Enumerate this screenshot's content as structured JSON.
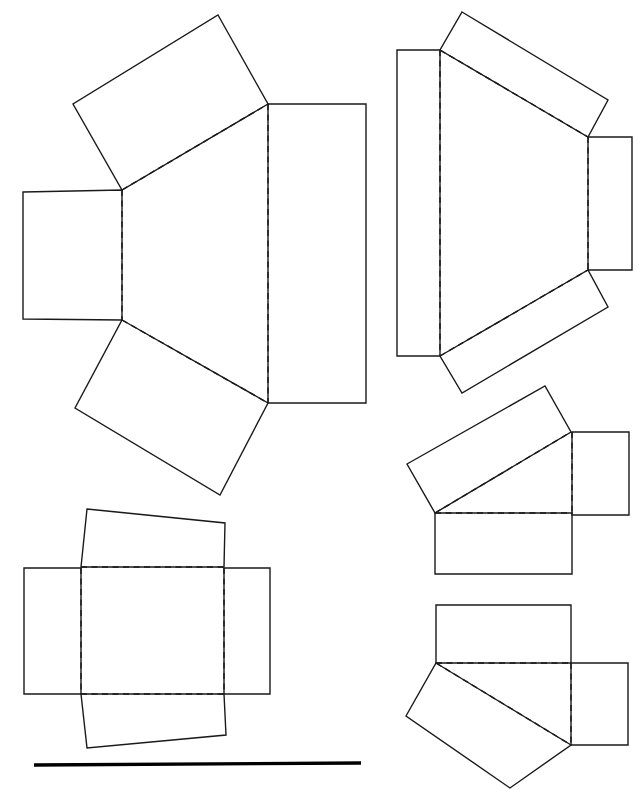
{
  "document": {
    "title": "Box Net Diagrams",
    "subject": "packaging carton blank layouts",
    "background_color": "#ffffff",
    "line_color": "#1a1a1a",
    "rule_color": "#000000",
    "canvas": {
      "width": 641,
      "height": 790
    }
  },
  "legend": {
    "solid_edge_meaning": "cut edge",
    "fold_edge_meaning": "fold / crease line",
    "solid_stroke_width": 1.4,
    "fold_stroke_width": 1.4,
    "fold_dash_pattern": "6 4.5"
  },
  "figures": [
    {
      "id": "figure-1",
      "name": "open-carton-net-large",
      "panel_count": 4,
      "panels": [
        {
          "name": "top-flap-panel",
          "shape": "quadrilateral",
          "points": "218,15 268,104 122,190 73,104",
          "fold_edges": [
            "122,190 268,104"
          ]
        },
        {
          "name": "left-side-panel",
          "shape": "rectangle",
          "points": "23,192 122,190 122,320 23,319",
          "fold_edges": [
            "122,190 122,320"
          ]
        },
        {
          "name": "bottom-flap-panel",
          "shape": "quadrilateral",
          "points": "122,320 268,403 220,495 75,408",
          "fold_edges": [
            "122,320 268,403"
          ]
        },
        {
          "name": "right-main-panel",
          "shape": "rectangle",
          "points": "268,104 366,104 366,403 268,403",
          "fold_edges": [
            "268,104 268,403"
          ]
        }
      ]
    },
    {
      "id": "figure-2",
      "name": "tapered-carton-net",
      "panel_count": 4,
      "panels": [
        {
          "name": "top-flap-panel",
          "shape": "quadrilateral",
          "points": "462,12 608,100 588,137 440,50",
          "fold_edges": [
            "440,50 588,137"
          ]
        },
        {
          "name": "left-main-panel",
          "shape": "rectangle",
          "points": "397,50 440,50 440,356 397,356",
          "fold_edges": [
            "440,50 440,356"
          ]
        },
        {
          "name": "bottom-flap-panel",
          "shape": "quadrilateral",
          "points": "440,356 588,270 608,307 462,393",
          "fold_edges": [
            "440,356 588,270"
          ]
        },
        {
          "name": "right-side-panel",
          "shape": "rectangle",
          "points": "588,137 632,137 632,270 588,270",
          "fold_edges": [
            "588,137 588,270"
          ]
        }
      ]
    },
    {
      "id": "figure-3",
      "name": "flat-cross-net",
      "panel_count": 4,
      "panels": [
        {
          "name": "top-flap-panel",
          "shape": "quadrilateral",
          "points": "87,509 225,523 224,567 81,567",
          "fold_edges": [
            "81,567 224,567"
          ]
        },
        {
          "name": "left-side-panel",
          "shape": "rectangle",
          "points": "24,568 81,568 81,694 24,694",
          "fold_edges": [
            "81,568 81,694"
          ]
        },
        {
          "name": "bottom-flap-panel",
          "shape": "quadrilateral",
          "points": "81,694 224,694 226,735 87,748",
          "fold_edges": [
            "81,694 224,694"
          ]
        },
        {
          "name": "right-side-panel",
          "shape": "rectangle",
          "points": "224,568 270,568 270,694 224,694",
          "fold_edges": [
            "224,568 224,694"
          ]
        }
      ]
    },
    {
      "id": "figure-4",
      "name": "angled-carton-net-upper",
      "panel_count": 3,
      "panels": [
        {
          "name": "tilted-top-panel",
          "shape": "quadrilateral",
          "points": "407,464 545,386 571,432 435,513",
          "fold_edges": [
            "435,513 571,432"
          ]
        },
        {
          "name": "bottom-panel",
          "shape": "rectangle",
          "points": "435,513 572,513 572,574 435,574",
          "fold_edges": [
            "435,513 572,513"
          ]
        },
        {
          "name": "right-side-panel",
          "shape": "rectangle",
          "points": "572,432 629,432 629,515 572,515",
          "fold_edges": [
            "572,432 572,515"
          ]
        }
      ]
    },
    {
      "id": "figure-5",
      "name": "angled-carton-net-lower",
      "panel_count": 3,
      "panels": [
        {
          "name": "top-panel",
          "shape": "rectangle",
          "points": "436,605 571,605 571,663 436,663",
          "fold_edges": [
            "436,663 571,663"
          ]
        },
        {
          "name": "tilted-bottom-panel",
          "shape": "quadrilateral",
          "points": "436,663 571,745 510,788 406,716",
          "fold_edges": [
            "436,663 571,745"
          ]
        },
        {
          "name": "right-side-panel",
          "shape": "rectangle",
          "points": "571,663 628,663 628,745 571,745",
          "fold_edges": [
            "571,663 571,745"
          ]
        }
      ]
    }
  ],
  "rule": {
    "name": "horizontal-rule",
    "x1": 34,
    "y1": 765,
    "x2": 361,
    "y2": 763,
    "thickness": 3.4
  }
}
